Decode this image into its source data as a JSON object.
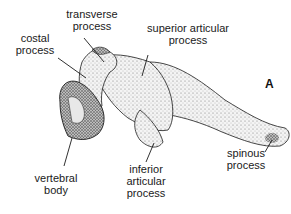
{
  "figure": {
    "panel_letter": "A",
    "labels": {
      "transverse_process": [
        "transverse",
        "process"
      ],
      "costal_process": [
        "costal",
        "process"
      ],
      "superior_articular_process": [
        "superior articular",
        "process"
      ],
      "vertebral_body": [
        "vertebral",
        "body"
      ],
      "inferior_articular_process": [
        "inferior",
        "articular",
        "process"
      ],
      "spinous_process": [
        "spinous",
        "process"
      ]
    }
  },
  "colors": {
    "ink": "#1a1a1a",
    "bone_fill": "#f2f2f2",
    "stipple": "#555555",
    "background": "#ffffff"
  }
}
